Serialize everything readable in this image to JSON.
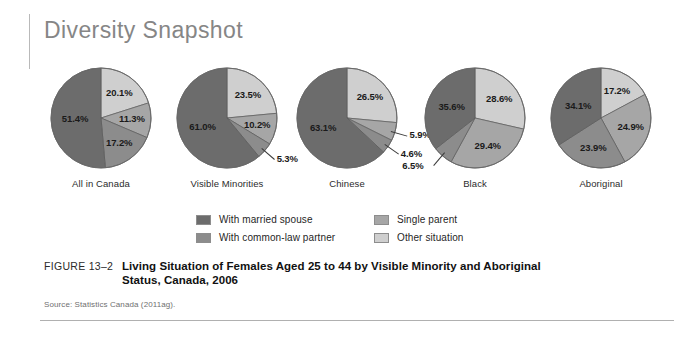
{
  "header": {
    "title": "Diversity Snapshot"
  },
  "legend": {
    "items": [
      {
        "label": "With married spouse",
        "color": "#6c6c6c",
        "key": "married"
      },
      {
        "label": "With common-law partner",
        "color": "#8c8c8c",
        "key": "commonlaw"
      },
      {
        "label": "Single parent",
        "color": "#a6a6a6",
        "key": "single"
      },
      {
        "label": "Other situation",
        "color": "#cfcfcf",
        "key": "other"
      }
    ]
  },
  "caption": {
    "figure_number": "FIGURE 13–2",
    "title": "Living Situation of Females Aged 25 to 44 by Visible Minority and Aboriginal Status, Canada, 2006",
    "source": "Source: Statistics Canada (2011ag)."
  },
  "chart_data": {
    "type": "pie",
    "title": "Living Situation of Females Aged 25 to 44 by Visible Minority and Aboriginal Status, Canada, 2006",
    "units": "percent",
    "legend_position": "bottom",
    "categories": [
      "With married spouse",
      "With common-law partner",
      "Single parent",
      "Other situation"
    ],
    "colors": [
      "#6c6c6c",
      "#8c8c8c",
      "#a6a6a6",
      "#cfcfcf"
    ],
    "charts": [
      {
        "name": "All in Canada",
        "slices": [
          {
            "label": "Other situation",
            "value": 20.1,
            "text": "20.1%"
          },
          {
            "label": "Single parent",
            "value": 11.3,
            "text": "11.3%"
          },
          {
            "label": "With common-law partner",
            "value": 17.2,
            "text": "17.2%"
          },
          {
            "label": "With married spouse",
            "value": 51.4,
            "text": "51.4%"
          }
        ]
      },
      {
        "name": "Visible Minorities",
        "slices": [
          {
            "label": "Other situation",
            "value": 23.5,
            "text": "23.5%"
          },
          {
            "label": "Single parent",
            "value": 10.2,
            "text": "10.2%"
          },
          {
            "label": "With common-law partner",
            "value": 5.3,
            "text": "5.3%"
          },
          {
            "label": "With married spouse",
            "value": 61.0,
            "text": "61.0%"
          }
        ]
      },
      {
        "name": "Chinese",
        "slices": [
          {
            "label": "Other situation",
            "value": 26.5,
            "text": "26.5%"
          },
          {
            "label": "Single parent",
            "value": 5.9,
            "text": "5.9%"
          },
          {
            "label": "With common-law partner",
            "value": 4.6,
            "text": "4.6%"
          },
          {
            "label": "With married spouse",
            "value": 63.1,
            "text": "63.1%"
          }
        ]
      },
      {
        "name": "Black",
        "slices": [
          {
            "label": "Other situation",
            "value": 28.6,
            "text": "28.6%"
          },
          {
            "label": "Single parent",
            "value": 29.4,
            "text": "29.4%"
          },
          {
            "label": "With common-law partner",
            "value": 6.5,
            "text": "6.5%"
          },
          {
            "label": "With married spouse",
            "value": 35.6,
            "text": "35.6%"
          }
        ]
      },
      {
        "name": "Aboriginal",
        "slices": [
          {
            "label": "Other situation",
            "value": 17.2,
            "text": "17.2%"
          },
          {
            "label": "Single parent",
            "value": 24.9,
            "text": "24.9%"
          },
          {
            "label": "With common-law partner",
            "value": 23.9,
            "text": "23.9%"
          },
          {
            "label": "With married spouse",
            "value": 34.1,
            "text": "34.1%"
          }
        ]
      }
    ]
  }
}
